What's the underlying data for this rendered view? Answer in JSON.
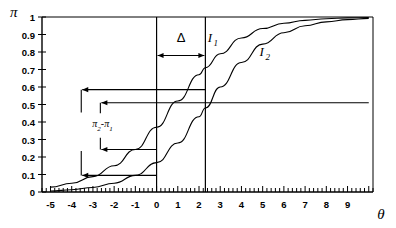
{
  "chart_data": {
    "type": "line",
    "title": "",
    "xlabel": "θ",
    "ylabel": "π",
    "xlim": [
      -5.4,
      10.2
    ],
    "ylim": [
      0,
      1
    ],
    "x_ticks": [
      -5,
      -4,
      -3,
      -2,
      -1,
      0,
      1,
      2,
      3,
      4,
      5,
      6,
      7,
      8,
      9
    ],
    "x_tick_labels": [
      "-5",
      "-4",
      "-3",
      "-2",
      "-1",
      "0",
      "1",
      "2",
      "3",
      "4",
      "5",
      "6",
      "7",
      "8",
      "9"
    ],
    "x_minor_per_unit": 5,
    "y_ticks": [
      0,
      0.1,
      0.2,
      0.3,
      0.4,
      0.5,
      0.6,
      0.7,
      0.8,
      0.9,
      1
    ],
    "y_tick_labels": [
      "0",
      "0.1",
      "0.2",
      "0.3",
      "0.4",
      "0.5",
      "0.6",
      "0.7",
      "0.8",
      "0.9",
      "1"
    ],
    "grid": false,
    "legend": "inline-annotation",
    "series": [
      {
        "name": "I_1",
        "label": "I",
        "sublabel": "1",
        "label_x": 2.65,
        "label_y": 0.88,
        "model": "logistic",
        "a": 0.62,
        "b": -0.35,
        "points_x": [
          -5,
          -4,
          -3,
          -2,
          -1,
          0,
          1,
          2,
          2.3,
          3,
          4,
          5,
          6,
          7,
          8,
          9,
          10
        ],
        "points_y": [
          0.028,
          0.05,
          0.088,
          0.15,
          0.243,
          0.37,
          0.52,
          0.67,
          0.71,
          0.79,
          0.88,
          0.934,
          0.964,
          0.981,
          0.99,
          0.995,
          0.997
        ]
      },
      {
        "name": "I_2",
        "label": "I",
        "sublabel": "2",
        "label_x": 5.1,
        "label_y": 0.8,
        "model": "logistic",
        "a": 0.36,
        "b": -0.82,
        "points_x": [
          -5,
          -4,
          -3,
          -2,
          -1,
          0,
          1,
          2,
          2.3,
          3,
          4,
          5,
          6,
          7,
          8,
          9,
          10
        ],
        "points_y": [
          0.006,
          0.013,
          0.026,
          0.05,
          0.095,
          0.168,
          0.28,
          0.43,
          0.48,
          0.6,
          0.74,
          0.845,
          0.91,
          0.95,
          0.972,
          0.985,
          0.992
        ]
      }
    ],
    "annotations": [
      {
        "name": "delta",
        "label": "Δ",
        "type": "double-arrow-horizontal",
        "x_start": 0.0,
        "x_end": 2.3,
        "y": 0.78,
        "label_x": 1.15,
        "label_y": 0.885
      },
      {
        "name": "pi-difference",
        "label": "π",
        "sub1": "2",
        "mid": "-",
        "label2": "π",
        "sub2": "1",
        "label_x": -2.55,
        "label_y": 0.395,
        "type": "bracket-pair"
      },
      {
        "name": "arrow-upper-outer",
        "type": "arrow-left",
        "y": 0.585,
        "x_from": 2.3,
        "x_to": -3.55
      },
      {
        "name": "arrow-upper-inner",
        "type": "arrow-left",
        "y": 0.51,
        "x_from": 10.0,
        "x_to": -2.65
      },
      {
        "name": "arrow-lower-inner",
        "type": "arrow-left",
        "y": 0.243,
        "x_from": 0.0,
        "x_to": -2.65
      },
      {
        "name": "arrow-lower-outer",
        "type": "arrow-left",
        "y": 0.095,
        "x_from": 0.0,
        "x_to": -3.55
      }
    ],
    "vertical_lines": [
      {
        "name": "theta-reference-0",
        "x": 0.0,
        "y_from": 0.0,
        "y_to": 1.0
      },
      {
        "name": "theta-reference-shift",
        "x": 2.3,
        "y_from": 0.0,
        "y_to": 1.0
      }
    ],
    "bracket_lines": [
      {
        "name": "bracket-outer-upper",
        "x": -3.55,
        "y_from": 0.585,
        "y_to": 0.455
      },
      {
        "name": "bracket-outer-lower",
        "x": -3.55,
        "y_from": 0.235,
        "y_to": 0.095
      },
      {
        "name": "bracket-inner-upper",
        "x": -2.65,
        "y_from": 0.51,
        "y_to": 0.45
      },
      {
        "name": "bracket-inner-lower",
        "x": -2.65,
        "y_from": 0.31,
        "y_to": 0.243
      }
    ],
    "frame": {
      "top": true,
      "right": true,
      "left_axis": true,
      "bottom_axis": true
    }
  }
}
